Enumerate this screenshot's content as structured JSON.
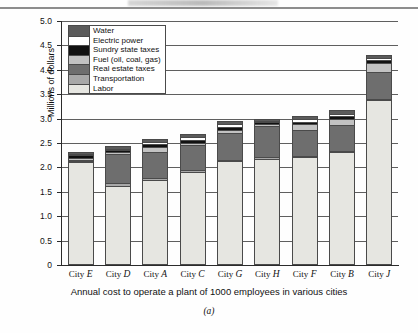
{
  "figure": {
    "caption": "(a)",
    "xtitle": "Annual cost to operate a plant of 1000 employees in various cities",
    "ytitle": "Millions of dollars"
  },
  "legend": {
    "entries": [
      {
        "label": "Water",
        "color": "#5b5b5b"
      },
      {
        "label": "Electric power",
        "color": "#ffffff"
      },
      {
        "label": "Sundry state taxes",
        "color": "#111111"
      },
      {
        "label": "Fuel (oil, coal, gas)",
        "color": "#c2c2c2"
      },
      {
        "label": "Real estate taxes",
        "color": "#6e6e6e"
      },
      {
        "label": "Transportation",
        "color": "#a8a8a8"
      },
      {
        "label": "Labor",
        "color": "#e6e6e1"
      }
    ]
  },
  "chart_data": {
    "type": "bar",
    "subtype": "stacked",
    "title": "",
    "xlabel": "Annual cost to operate a plant of 1000 employees in various cities",
    "ylabel": "Millions of dollars",
    "ylim": [
      0,
      5.0
    ],
    "yticks": [
      "0",
      "0.5",
      "1.0",
      "1.5",
      "2.0",
      "2.5",
      "3.0",
      "3.5",
      "4.0",
      "4.5",
      "5.0"
    ],
    "ytick_values": [
      0,
      0.5,
      1.0,
      1.5,
      2.0,
      2.5,
      3.0,
      3.5,
      4.0,
      4.5,
      5.0
    ],
    "grid": "horizontal",
    "legend_position": "upper-left-inside",
    "units": "millions of dollars",
    "categories": [
      "City E",
      "City D",
      "City A",
      "City C",
      "City G",
      "City H",
      "City F",
      "City B",
      "City J"
    ],
    "category_city_letters": [
      "E",
      "D",
      "A",
      "C",
      "G",
      "H",
      "F",
      "B",
      "J"
    ],
    "series": [
      {
        "name": "Labor",
        "color": "#e6e6e1",
        "values": [
          2.07,
          1.58,
          1.71,
          1.87,
          2.09,
          2.14,
          2.17,
          2.28,
          3.35
        ]
      },
      {
        "name": "Transportation",
        "color": "#a8a8a8",
        "values": [
          0.03,
          0.06,
          0.04,
          0.04,
          0.03,
          0.03,
          0.03,
          0.02,
          0.02
        ]
      },
      {
        "name": "Real estate taxes",
        "color": "#6e6e6e",
        "values": [
          0.02,
          0.6,
          0.52,
          0.5,
          0.54,
          0.64,
          0.52,
          0.52,
          0.54
        ]
      },
      {
        "name": "Fuel (oil, coal, gas)",
        "color": "#c2c2c2",
        "values": [
          0.04,
          0.03,
          0.11,
          0.04,
          0.06,
          0.03,
          0.12,
          0.13,
          0.19
        ]
      },
      {
        "name": "Sundry state taxes",
        "color": "#111111",
        "values": [
          0.05,
          0.04,
          0.06,
          0.07,
          0.07,
          0.05,
          0.06,
          0.06,
          0.07
        ]
      },
      {
        "name": "Electric power",
        "color": "#ffffff",
        "values": [
          0.03,
          0.03,
          0.04,
          0.06,
          0.05,
          0.03,
          0.06,
          0.04,
          0.04
        ]
      },
      {
        "name": "Water",
        "color": "#5b5b5b",
        "values": [
          0.03,
          0.05,
          0.06,
          0.07,
          0.07,
          0.04,
          0.06,
          0.09,
          0.06
        ]
      }
    ],
    "totals": [
      2.27,
      2.39,
      2.54,
      2.65,
      2.91,
      2.96,
      3.02,
      3.14,
      4.27
    ]
  }
}
